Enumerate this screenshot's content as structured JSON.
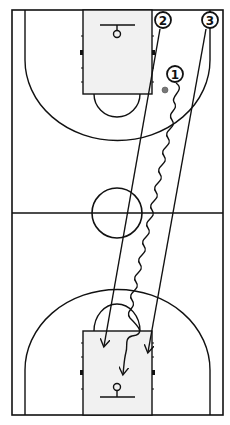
{
  "diagram": {
    "type": "basketball-play",
    "court": {
      "left": 12,
      "top": 10,
      "right": 223,
      "bottom": 415,
      "line_color": "#111111",
      "key_fill": "#f1f1f1"
    },
    "players": [
      {
        "id": "1",
        "label": "1",
        "x": 175,
        "y": 74,
        "has_ball": true
      },
      {
        "id": "2",
        "label": "2",
        "x": 163,
        "y": 20,
        "has_ball": false
      },
      {
        "id": "3",
        "label": "3",
        "x": 210,
        "y": 20,
        "has_ball": false
      }
    ],
    "ball": {
      "x": 165,
      "y": 90,
      "color": "#777777"
    },
    "actions": [
      {
        "player": "1",
        "type": "dribble",
        "from": "player 1",
        "to": "bottom lane, in front of basket"
      },
      {
        "player": "2",
        "type": "cut",
        "from": "top right lane",
        "to": "bottom left lane block"
      },
      {
        "player": "3",
        "type": "cut",
        "from": "top right corner",
        "to": "bottom right lane block"
      }
    ]
  }
}
